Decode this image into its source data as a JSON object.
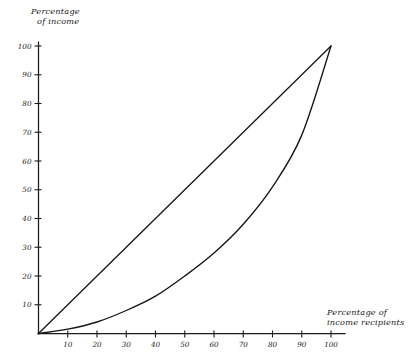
{
  "chart_data": {
    "type": "line",
    "title": "",
    "xlabel": "Percentage of income recipients",
    "ylabel": "Percentage of income",
    "xlim": [
      0,
      100
    ],
    "ylim": [
      0,
      100
    ],
    "grid": false,
    "legend": "none",
    "xticks": [
      10,
      20,
      30,
      40,
      50,
      60,
      70,
      80,
      90,
      100
    ],
    "xtick_labels": [
      "10",
      "20",
      "30",
      "40",
      "50",
      "60",
      "70",
      "80",
      "90",
      "100"
    ],
    "yticks": [
      10,
      20,
      30,
      40,
      50,
      60,
      70,
      80,
      90,
      100
    ],
    "ytick_labels": [
      "10",
      "20",
      "30",
      "40",
      "50",
      "60",
      "70",
      "80",
      "90",
      "100"
    ],
    "series": [
      {
        "name": "Line of equality",
        "style": "straight-diagonal",
        "x": [
          0,
          10,
          20,
          30,
          40,
          50,
          60,
          70,
          80,
          90,
          100
        ],
        "values": [
          0,
          10,
          20,
          30,
          40,
          50,
          60,
          70,
          80,
          90,
          100
        ]
      },
      {
        "name": "Lorenz curve",
        "style": "convex-curve",
        "x": [
          0,
          10,
          20,
          30,
          40,
          50,
          60,
          70,
          80,
          90,
          100
        ],
        "values": [
          0,
          1.5,
          4,
          8,
          13,
          20,
          28,
          38,
          51,
          69,
          100
        ]
      }
    ],
    "annotations": []
  },
  "axes": {
    "y_title_line1": "Percentage",
    "y_title_line2": "of income",
    "x_title_line1": "Percentage of",
    "x_title_line2": "income recipients"
  }
}
